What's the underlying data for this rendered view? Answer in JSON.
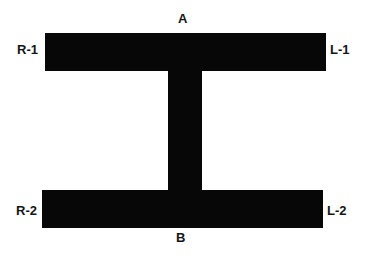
{
  "figure": {
    "type": "i-beam-cross-section-diagram",
    "background_color": "#ffffff",
    "shape_color": "#070707",
    "label_color": "#141414",
    "labels": {
      "top_center": "A",
      "bottom_center": "B",
      "top_left": "R-1",
      "top_right": "L-1",
      "bottom_left": "R-2",
      "bottom_right": "L-2"
    },
    "parts": {
      "top_flange": "top-flange",
      "bottom_flange": "bottom-flange",
      "web": "vertical-web"
    }
  }
}
